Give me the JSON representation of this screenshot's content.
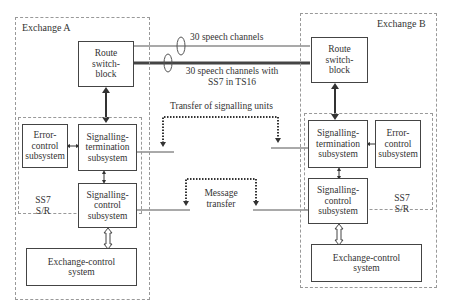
{
  "exchange_a": {
    "title": "Exchange A",
    "route_switch_block": [
      "Route",
      "switch-",
      "block"
    ],
    "error_control": [
      "Error-",
      "control",
      "subsystem"
    ],
    "signalling_termination": [
      "Signalling-",
      "termination",
      "subsystem"
    ],
    "signalling_control": [
      "Signalling-",
      "control",
      "subsystem"
    ],
    "ss7_label": [
      "SS7",
      "S/R"
    ],
    "exchange_control": [
      "Exchange-control",
      "system"
    ]
  },
  "exchange_b": {
    "title": "Exchange B",
    "route_switch_block": [
      "Route",
      "switch-",
      "block"
    ],
    "error_control": [
      "Error-",
      "control",
      "subsystem"
    ],
    "signalling_termination": [
      "Signalling-",
      "termination",
      "subsystem"
    ],
    "signalling_control": [
      "Signalling-",
      "control",
      "subsystem"
    ],
    "ss7_label": [
      "SS7",
      "S/R"
    ],
    "exchange_control": [
      "Exchange-control",
      "system"
    ]
  },
  "links": {
    "speech_channels": "30 speech channels",
    "speech_channels_ss7": [
      "30 speech channels with",
      "SS7 in TS16"
    ],
    "transfer_signalling_units": "Transfer of signalling units",
    "message_transfer": [
      "Message",
      "transfer"
    ]
  }
}
